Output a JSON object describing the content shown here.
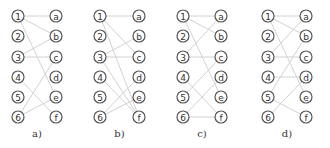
{
  "figure": {
    "left_labels": [
      "1",
      "2",
      "3",
      "4",
      "5",
      "6"
    ],
    "right_labels": [
      "a",
      "b",
      "c",
      "d",
      "e",
      "f"
    ],
    "row_y": [
      16,
      36,
      57,
      77,
      97,
      117
    ],
    "panels": [
      {
        "id": "a",
        "caption": "a)",
        "left_x": 18,
        "right_x": 56,
        "caption_x": 18,
        "edges": [
          [
            "1",
            "a"
          ],
          [
            "1",
            "b"
          ],
          [
            "1",
            "e"
          ],
          [
            "3",
            "b"
          ],
          [
            "3",
            "c"
          ],
          [
            "4",
            "f"
          ],
          [
            "6",
            "c"
          ],
          [
            "6",
            "e"
          ]
        ]
      },
      {
        "id": "b",
        "caption": "b)",
        "left_x": 100,
        "right_x": 139,
        "caption_x": 100,
        "edges": [
          [
            "1",
            "a"
          ],
          [
            "1",
            "c"
          ],
          [
            "1",
            "f"
          ],
          [
            "3",
            "b"
          ],
          [
            "3",
            "c"
          ],
          [
            "3",
            "f"
          ],
          [
            "4",
            "f"
          ],
          [
            "6",
            "d"
          ],
          [
            "6",
            "e"
          ]
        ]
      },
      {
        "id": "c",
        "caption": "c)",
        "left_x": 183,
        "right_x": 221,
        "caption_x": 183,
        "edges": [
          [
            "1",
            "a"
          ],
          [
            "1",
            "b"
          ],
          [
            "1",
            "e"
          ],
          [
            "3",
            "a"
          ],
          [
            "3",
            "c"
          ],
          [
            "4",
            "f"
          ],
          [
            "5",
            "c"
          ],
          [
            "6",
            "d"
          ],
          [
            "6",
            "f"
          ]
        ]
      },
      {
        "id": "d",
        "caption": "d)",
        "left_x": 268,
        "right_x": 306,
        "caption_x": 268,
        "edges": [
          [
            "1",
            "a"
          ],
          [
            "1",
            "b"
          ],
          [
            "1",
            "e"
          ],
          [
            "3",
            "a"
          ],
          [
            "3",
            "c"
          ],
          [
            "4",
            "d"
          ],
          [
            "5",
            "b"
          ],
          [
            "5",
            "f"
          ],
          [
            "6",
            "d"
          ]
        ]
      }
    ]
  }
}
